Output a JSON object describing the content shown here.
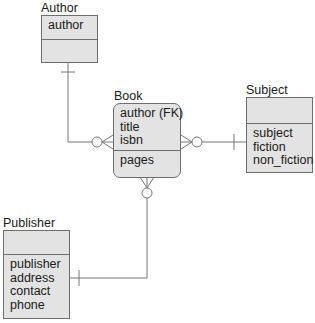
{
  "diagram": {
    "type": "entity-relationship",
    "entities": [
      {
        "id": "author",
        "name": "Author",
        "key_attributes": [
          "author"
        ],
        "attributes": []
      },
      {
        "id": "book",
        "name": "Book",
        "key_attributes": [
          "author (FK)",
          "title",
          "isbn"
        ],
        "attributes": [
          "pages"
        ]
      },
      {
        "id": "subject",
        "name": "Subject",
        "key_attributes": [],
        "attributes": [
          "subject",
          "fiction",
          "non_fiction"
        ]
      },
      {
        "id": "publisher",
        "name": "Publisher",
        "key_attributes": [],
        "attributes": [
          "publisher",
          "address",
          "contact",
          "phone"
        ]
      }
    ],
    "relationships": [
      {
        "from": "author",
        "to": "book",
        "from_cardinality": "one",
        "to_cardinality": "zero-or-many"
      },
      {
        "from": "subject",
        "to": "book",
        "from_cardinality": "one",
        "to_cardinality": "zero-or-many"
      },
      {
        "from": "publisher",
        "to": "book",
        "from_cardinality": "one",
        "to_cardinality": "zero-or-many"
      }
    ],
    "colors": {
      "entity_fill": "#e3e3e3",
      "stroke": "#6e6e6e",
      "line": "#777777"
    }
  }
}
